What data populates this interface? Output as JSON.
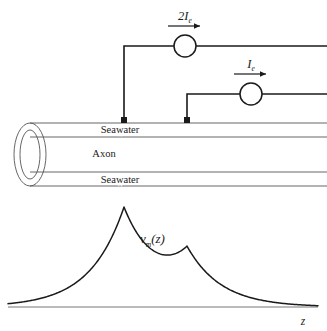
{
  "figure": {
    "background_color": "#ffffff",
    "ink_color": "#1a1a1a",
    "line_color": "#555555",
    "width": 327,
    "height": 331
  },
  "circuit": {
    "sources": [
      {
        "id": "source-upper",
        "label": "2I",
        "label_subscript": "e",
        "label_full": "2I_e",
        "arrow_direction": "right",
        "circle_center_x": 185,
        "circle_center_y": 46,
        "circle_radius": 11,
        "electrode_x": 124,
        "wire_top_y": 46,
        "label_x": 185,
        "label_y": 18
      },
      {
        "id": "source-lower",
        "label": "I",
        "label_subscript": "e",
        "label_full": "I_e",
        "arrow_direction": "right",
        "circle_center_x": 251,
        "circle_center_y": 94,
        "circle_radius": 11,
        "electrode_x": 187,
        "wire_top_y": 94,
        "label_x": 251,
        "label_y": 66
      }
    ],
    "electrodes": [
      {
        "id": "electrode-left",
        "x": 124,
        "y": 120,
        "size": 6
      },
      {
        "id": "electrode-right",
        "x": 187,
        "y": 120,
        "size": 6
      }
    ]
  },
  "axon": {
    "label": "Axon",
    "label_x": 104,
    "label_y": 157,
    "seawater_label_top": "Seawater",
    "seawater_label_bottom": "Seawater",
    "seawater_top_x": 120,
    "seawater_top_y": 133,
    "seawater_bottom_x": 120,
    "seawater_bottom_y": 183,
    "outer_top_y": 123,
    "inner_top_y": 137,
    "inner_bottom_y": 172,
    "outer_bottom_y": 186,
    "left_x": 30,
    "right_x": 327,
    "cap_center_x": 30,
    "cap_center_y": 154.5,
    "cap_outer_rx": 16,
    "cap_outer_ry": 31.5,
    "cap_inner_rx": 10,
    "cap_inner_ry": 24.5
  },
  "plot": {
    "curve_label": "v",
    "curve_label_subscript": "m",
    "curve_label_arg": "(z)",
    "curve_label_full": "v_m(z)",
    "curve_label_x": 140,
    "curve_label_y": 240,
    "axis_label": "z",
    "axis_label_x": 303,
    "axis_label_y": 324,
    "baseline_y": 307,
    "baseline_x_start": 8,
    "baseline_x_end": 318
  },
  "chart_data": {
    "type": "line",
    "xlabel": "z",
    "ylabel": "v_m(z)",
    "grid": false,
    "legend": false,
    "xlim": [
      8,
      318
    ],
    "ylim": [
      0,
      100
    ],
    "peaks": [
      {
        "name": "2I_e peak",
        "x": 124,
        "y": 100,
        "amplitude": 2,
        "decay_length": 34
      },
      {
        "name": "I_e peak",
        "x": 187,
        "y": 59,
        "amplitude": 1,
        "decay_length": 34
      }
    ],
    "x": [
      8,
      20,
      32,
      44,
      56,
      68,
      80,
      92,
      104,
      112,
      118,
      124,
      130,
      138,
      146,
      154,
      162,
      170,
      178,
      184,
      187,
      190,
      196,
      204,
      212,
      220,
      232,
      244,
      256,
      268,
      280,
      292,
      304,
      318
    ],
    "values": [
      1,
      1,
      2,
      3,
      4,
      6,
      9,
      14,
      23,
      33,
      44,
      100,
      62,
      46,
      37,
      32,
      31,
      34,
      43,
      54,
      59,
      55,
      43,
      32,
      24,
      18,
      11,
      7,
      4,
      3,
      2,
      1,
      1,
      1
    ]
  }
}
